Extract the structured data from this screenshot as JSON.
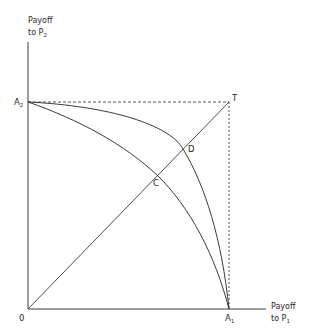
{
  "axes": {
    "y_label_line1": "Payoff",
    "y_label_line2": "to P",
    "y_label_sub": "2",
    "x_label_line1": "Payoff",
    "x_label_line2": "to P",
    "x_label_sub": "1",
    "origin_label": "0"
  },
  "points": {
    "A2": {
      "label": "A",
      "sub": "2"
    },
    "A1": {
      "label": "A",
      "sub": "1"
    },
    "T": {
      "label": "T"
    },
    "C": {
      "label": "C"
    },
    "D": {
      "label": "D"
    }
  },
  "colors": {
    "line": "#3a3a3a",
    "dashed": "#555555"
  }
}
